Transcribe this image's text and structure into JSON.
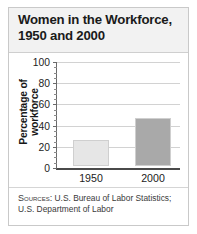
{
  "card": {
    "title": "Women in the Workforce,\n1950 and 2000"
  },
  "sources": {
    "label": "Sources:",
    "text": " U.S. Bureau of Labor Statistics; U.S. Department of Labor"
  },
  "colors": {
    "bar_1950": "#e6e6e6",
    "bar_2000": "#a9a9a9",
    "header_bg": "#f2f2f2",
    "gridline": "#d2d2d2",
    "axis": "#4a4a4a"
  },
  "chart_data": {
    "type": "bar",
    "title": "Women in the Workforce, 1950 and 2000",
    "xlabel": "",
    "ylabel": "Percentage of workforce",
    "categories": [
      "1950",
      "2000"
    ],
    "values": [
      25,
      45
    ],
    "ylim": [
      0,
      100
    ],
    "yticks": [
      0,
      20,
      40,
      60,
      80,
      100
    ],
    "minor_tick_interval": 5,
    "grid": true,
    "legend": false,
    "bar_colors": [
      "#e6e6e6",
      "#a9a9a9"
    ]
  }
}
